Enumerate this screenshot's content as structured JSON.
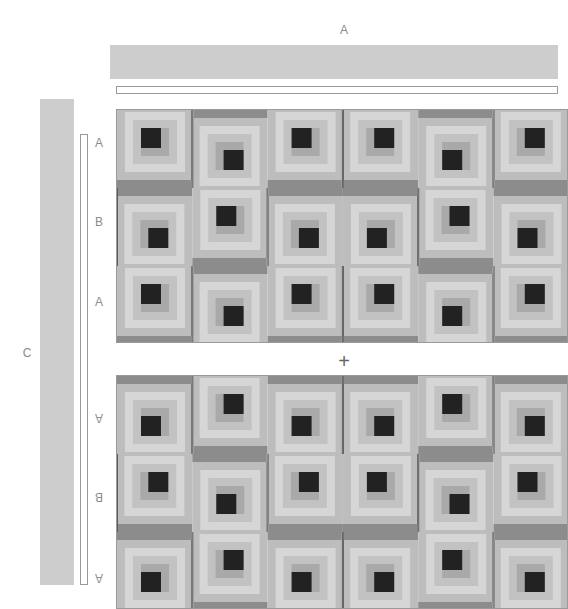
{
  "diagram": {
    "top_label": "A",
    "side_label": "C",
    "join_symbol": "+",
    "row_labels_top": [
      "A",
      "B",
      "A"
    ],
    "row_labels_bottom": [
      "A",
      "B",
      "A"
    ]
  },
  "colors": {
    "border_bar": "#cdcdcd",
    "outline": "#9a9a9a",
    "label": "#8a8a8a",
    "center": "#222222",
    "rings": [
      "#a9a9a9",
      "#c2c2c2",
      "#d6d6d6",
      "#bdbdbd"
    ],
    "outer_medium": "#8c8c8c",
    "outer_dark": "#5c5c5c"
  },
  "panels": [
    {
      "name": "top",
      "rows": [
        [
          "BR",
          "TL",
          "BR",
          "BL",
          "TR",
          "BL"
        ],
        [
          "TL",
          "BR",
          "TL",
          "TR",
          "BL",
          "TR"
        ],
        [
          "BR",
          "TL",
          "BR",
          "BL",
          "TR",
          "BL"
        ]
      ]
    },
    {
      "name": "bottom",
      "rows": [
        [
          "TR",
          "BL",
          "TR",
          "TL",
          "BR",
          "TL"
        ],
        [
          "BL",
          "TR",
          "BL",
          "BR",
          "TL",
          "BR"
        ],
        [
          "TR",
          "BL",
          "TR",
          "TL",
          "BR",
          "TL"
        ]
      ]
    }
  ]
}
